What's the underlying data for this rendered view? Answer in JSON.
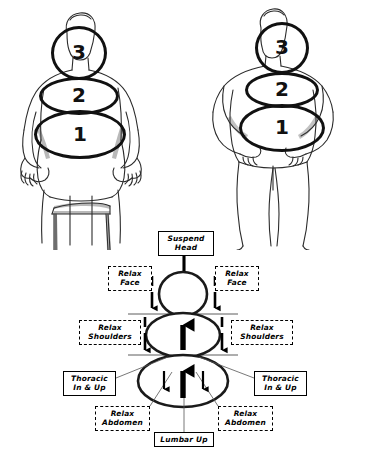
{
  "page": {
    "background_color": "#ffffff",
    "ink_color": "#000000"
  },
  "figures": [
    {
      "name": "seated-figure",
      "posture": "seated on a stool, hands resting on thighs, viewed from front",
      "zones": [
        {
          "number": "3",
          "region": "head"
        },
        {
          "number": "2",
          "region": "chest"
        },
        {
          "number": "1",
          "region": "abdomen"
        }
      ]
    },
    {
      "name": "standing-figure",
      "posture": "standing with hands on hips, viewed from front",
      "zones": [
        {
          "number": "3",
          "region": "head"
        },
        {
          "number": "2",
          "region": "chest"
        },
        {
          "number": "1",
          "region": "abdomen"
        }
      ]
    }
  ],
  "diagram": {
    "labels": {
      "suspend_head": "Suspend\nHead",
      "relax_face": "Relax\nFace",
      "relax_shoulders": "Relax\nShoulders",
      "thoracic_in_up": "Thoracic\nIn & Up",
      "relax_abdomen": "Relax\nAbdomen",
      "lumbar_up": "Lumbar Up"
    },
    "label_boxes": [
      {
        "id": "suspend-head",
        "text": "Suspend Head",
        "line1": "Suspend",
        "line2": "Head",
        "border": "solid",
        "side": "center"
      },
      {
        "id": "relax-face-left",
        "text": "Relax Face",
        "line1": "Relax",
        "line2": "Face",
        "border": "dashed",
        "side": "left"
      },
      {
        "id": "relax-face-right",
        "text": "Relax Face",
        "line1": "Relax",
        "line2": "Face",
        "border": "dashed",
        "side": "right"
      },
      {
        "id": "relax-shoulders-left",
        "text": "Relax Shoulders",
        "line1": "Relax",
        "line2": "Shoulders",
        "border": "dashed",
        "side": "left"
      },
      {
        "id": "relax-shoulders-right",
        "text": "Relax Shoulders",
        "line1": "Relax",
        "line2": "Shoulders",
        "border": "dashed",
        "side": "right"
      },
      {
        "id": "thoracic-left",
        "text": "Thoracic In & Up",
        "line1": "Thoracic",
        "line2": "In & Up",
        "border": "solid",
        "side": "left"
      },
      {
        "id": "thoracic-right",
        "text": "Thoracic In & Up",
        "line1": "Thoracic",
        "line2": "In & Up",
        "border": "solid",
        "side": "right"
      },
      {
        "id": "relax-abdomen-left",
        "text": "Relax Abdomen",
        "line1": "Relax",
        "line2": "Abdomen",
        "border": "dashed",
        "side": "left"
      },
      {
        "id": "relax-abdomen-right",
        "text": "Relax Abdomen",
        "line1": "Relax",
        "line2": "Abdomen",
        "border": "dashed",
        "side": "right"
      },
      {
        "id": "lumbar-up",
        "text": "Lumbar Up",
        "line1": "Lumbar Up",
        "line2": "",
        "border": "solid",
        "side": "center"
      }
    ],
    "ellipses": [
      {
        "id": "head-circle",
        "zone": "3",
        "shape": "circle"
      },
      {
        "id": "chest-ellipse",
        "zone": "2",
        "shape": "ellipse"
      },
      {
        "id": "abdomen-ellipse",
        "zone": "1",
        "shape": "ellipse"
      }
    ],
    "arrows": [
      {
        "id": "suspend-head-arrow",
        "direction": "up",
        "size": "medium",
        "location": "above head circle"
      },
      {
        "id": "relax-face-arrow-left",
        "direction": "down",
        "size": "small",
        "location": "left of head circle"
      },
      {
        "id": "relax-face-arrow-right",
        "direction": "down",
        "size": "small",
        "location": "right of head circle"
      },
      {
        "id": "chest-lift-arrow",
        "direction": "up",
        "size": "large",
        "location": "inside chest ellipse"
      },
      {
        "id": "relax-shoulders-arrow-left",
        "direction": "down",
        "size": "small",
        "location": "left of chest ellipse"
      },
      {
        "id": "relax-shoulders-arrow-right",
        "direction": "down",
        "size": "small",
        "location": "right of chest ellipse"
      },
      {
        "id": "lumbar-lift-arrow",
        "direction": "up",
        "size": "large",
        "location": "inside abdomen ellipse"
      },
      {
        "id": "abdomen-relax-arrow-left",
        "direction": "down",
        "size": "small",
        "location": "inside abdomen ellipse left"
      },
      {
        "id": "abdomen-relax-arrow-right",
        "direction": "down",
        "size": "small",
        "location": "inside abdomen ellipse right"
      }
    ]
  }
}
